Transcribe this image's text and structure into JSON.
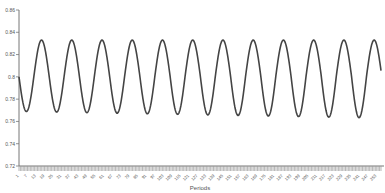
{
  "chart_data": {
    "type": "line",
    "title": "",
    "xlabel": "Periods",
    "ylabel": "",
    "ylim": [
      0.72,
      0.86
    ],
    "yticks": [
      0.86,
      0.84,
      0.82,
      0.8,
      0.78,
      0.76,
      0.74,
      0.72
    ],
    "ytick_labels": [
      "0.86",
      "0.84",
      "0.82",
      "0.8",
      "0.78",
      "0.76",
      "0.74",
      "0.72"
    ],
    "x_range": [
      1,
      256
    ],
    "xtick_step": 6,
    "xtick_labels": [
      "1",
      "7",
      "13",
      "19",
      "25",
      "31",
      "37",
      "43",
      "49",
      "55",
      "61",
      "67",
      "73",
      "79",
      "85",
      "91",
      "97",
      "103",
      "109",
      "115",
      "121",
      "127",
      "133",
      "139",
      "145",
      "151",
      "157",
      "163",
      "169",
      "175",
      "181",
      "187",
      "193",
      "199",
      "205",
      "211",
      "217",
      "223",
      "229",
      "235",
      "241",
      "247",
      "253"
    ],
    "grid": false,
    "legend": null,
    "series": [
      {
        "name": "series-1",
        "description": "Sinusoidal oscillation starting at ~0.80, dipping first, ~12 cycles over 256 periods",
        "start_value": 0.8,
        "end_value": 0.79,
        "peak_value": 0.833,
        "trough_values_range": [
          0.766,
          0.772
        ],
        "cycle_length_periods": 21.3,
        "num_peaks": 12,
        "peak_periods_approx": [
          17,
          38,
          59,
          81,
          102,
          123,
          145,
          166,
          187,
          209,
          230,
          251
        ],
        "trough_periods_approx": [
          6,
          28,
          49,
          70,
          91,
          113,
          134,
          155,
          177,
          198,
          219,
          241
        ]
      }
    ]
  },
  "colors": {
    "line": "#444444",
    "axis": "#777777",
    "tick_band": "#999999",
    "label": "#555555",
    "background": "#ffffff"
  }
}
